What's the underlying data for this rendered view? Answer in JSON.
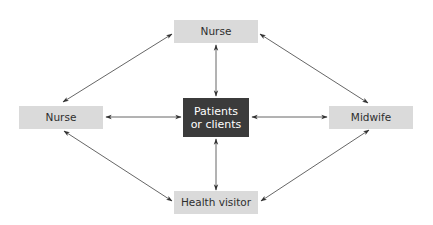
{
  "diagram": {
    "type": "hub-and-ring relationship diagram",
    "colors": {
      "node_fill": "#dadada",
      "center_fill": "#3b3b3b",
      "center_text": "#ffffff",
      "node_text": "#2e2e2e",
      "arrow": "#555555"
    },
    "nodes": {
      "top": {
        "label": "Nurse"
      },
      "left": {
        "label": "Nurse"
      },
      "right": {
        "label": "Midwife"
      },
      "bottom": {
        "label": "Health visitor"
      },
      "center": {
        "label": "Patients\nor clients"
      }
    },
    "edges": [
      {
        "from": "top",
        "to": "center",
        "direction": "bidirectional"
      },
      {
        "from": "bottom",
        "to": "center",
        "direction": "bidirectional"
      },
      {
        "from": "left",
        "to": "center",
        "direction": "bidirectional"
      },
      {
        "from": "right",
        "to": "center",
        "direction": "bidirectional"
      },
      {
        "from": "top",
        "to": "left",
        "direction": "bidirectional"
      },
      {
        "from": "top",
        "to": "right",
        "direction": "bidirectional"
      },
      {
        "from": "bottom",
        "to": "left",
        "direction": "bidirectional"
      },
      {
        "from": "bottom",
        "to": "right",
        "direction": "bidirectional"
      }
    ]
  }
}
